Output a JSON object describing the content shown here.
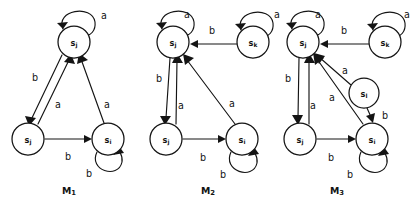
{
  "figure": {
    "width": 414,
    "height": 209,
    "background_color": "#ffffff",
    "ink_color": "#141414",
    "caption_note": "Three finite state machine transition diagrams drawn side by side"
  },
  "symbols": {
    "a": "a",
    "b": "b"
  },
  "machines": [
    {
      "id": "m1",
      "label_base": "M",
      "label_sub": "1",
      "label_x": 69,
      "label_y": 190,
      "states": [
        {
          "id": "sk",
          "base": "s",
          "sub": "j",
          "cx": 74,
          "cy": 42,
          "r": 16
        },
        {
          "id": "sj",
          "base": "s",
          "sub": "j",
          "cx": 28,
          "cy": 139,
          "r": 16
        },
        {
          "id": "si",
          "base": "s",
          "sub": "i",
          "cx": 108,
          "cy": 139,
          "r": 16
        }
      ],
      "edges": [
        {
          "from": "sk",
          "to": "sk",
          "symbol": "a",
          "kind": "self-loop",
          "label_x": 104,
          "label_y": 15
        },
        {
          "from": "sk",
          "to": "sj",
          "symbol": "b",
          "kind": "straight",
          "label_x": 35,
          "label_y": 77
        },
        {
          "from": "sj",
          "to": "sk",
          "symbol": "a",
          "kind": "straight",
          "label_x": 58,
          "label_y": 104
        },
        {
          "from": "sj",
          "to": "si",
          "symbol": "b",
          "kind": "straight",
          "label_x": 68,
          "label_y": 156
        },
        {
          "from": "si",
          "to": "sk",
          "symbol": "a",
          "kind": "straight",
          "label_x": 107,
          "label_y": 104
        },
        {
          "from": "si",
          "to": "si",
          "symbol": "b",
          "kind": "self-loop",
          "label_x": 89,
          "label_y": 173
        }
      ]
    },
    {
      "id": "m2",
      "label_base": "M",
      "label_sub": "2",
      "label_x": 208,
      "label_y": 190,
      "states": [
        {
          "id": "sk",
          "base": "s",
          "sub": "j",
          "cx": 173,
          "cy": 42,
          "r": 16
        },
        {
          "id": "sl",
          "base": "s",
          "sub": "k",
          "cx": 253,
          "cy": 42,
          "r": 16
        },
        {
          "id": "sj",
          "base": "s",
          "sub": "j",
          "cx": 166,
          "cy": 139,
          "r": 16
        },
        {
          "id": "si",
          "base": "s",
          "sub": "i",
          "cx": 242,
          "cy": 139,
          "r": 16
        }
      ],
      "edges": [
        {
          "from": "sk",
          "to": "sk",
          "symbol": "a",
          "kind": "self-loop",
          "label_x": 187,
          "label_y": 14
        },
        {
          "from": "sl",
          "to": "sl",
          "symbol": "a",
          "kind": "self-loop",
          "label_x": 277,
          "label_y": 14
        },
        {
          "from": "sl",
          "to": "sk",
          "symbol": "b",
          "kind": "straight",
          "label_x": 212,
          "label_y": 30
        },
        {
          "from": "sk",
          "to": "sj",
          "symbol": "b",
          "kind": "straight",
          "label_x": 159,
          "label_y": 78
        },
        {
          "from": "sj",
          "to": "sk",
          "symbol": "a",
          "kind": "straight",
          "label_x": 181,
          "label_y": 105
        },
        {
          "from": "sj",
          "to": "si",
          "symbol": "b",
          "kind": "straight",
          "label_x": 203,
          "label_y": 157
        },
        {
          "from": "si",
          "to": "sk",
          "symbol": "a",
          "kind": "straight",
          "label_x": 232,
          "label_y": 103
        },
        {
          "from": "si",
          "to": "si",
          "symbol": "b",
          "kind": "self-loop",
          "label_x": 223,
          "label_y": 174
        }
      ]
    },
    {
      "id": "m3",
      "label_base": "M",
      "label_sub": "3",
      "label_x": 337,
      "label_y": 190,
      "states": [
        {
          "id": "sk",
          "base": "s",
          "sub": "j",
          "cx": 303,
          "cy": 42,
          "r": 16
        },
        {
          "id": "sm",
          "base": "s",
          "sub": "k",
          "cx": 385,
          "cy": 42,
          "r": 16
        },
        {
          "id": "sl",
          "base": "s",
          "sub": "l",
          "cx": 364,
          "cy": 93,
          "r": 15
        },
        {
          "id": "sj",
          "base": "s",
          "sub": "j",
          "cx": 300,
          "cy": 139,
          "r": 16
        },
        {
          "id": "si",
          "base": "s",
          "sub": "i",
          "cx": 372,
          "cy": 139,
          "r": 16
        }
      ],
      "edges": [
        {
          "from": "sk",
          "to": "sk",
          "symbol": "a",
          "kind": "self-loop",
          "label_x": 318,
          "label_y": 14
        },
        {
          "from": "sm",
          "to": "sm",
          "symbol": "a",
          "kind": "self-loop",
          "label_x": 407,
          "label_y": 14
        },
        {
          "from": "sm",
          "to": "sk",
          "symbol": "b",
          "kind": "straight",
          "label_x": 344,
          "label_y": 30
        },
        {
          "from": "sk",
          "to": "sj",
          "symbol": "b",
          "kind": "straight",
          "label_x": 288,
          "label_y": 78
        },
        {
          "from": "sj",
          "to": "sk",
          "symbol": "a",
          "kind": "straight",
          "label_x": 313,
          "label_y": 105
        },
        {
          "from": "sl",
          "to": "sk",
          "symbol": "a",
          "kind": "straight",
          "label_x": 345,
          "label_y": 70
        },
        {
          "from": "sl",
          "to": "si",
          "symbol": "b",
          "kind": "straight",
          "label_x": 385,
          "label_y": 115
        },
        {
          "from": "si",
          "to": "sk",
          "symbol": "a",
          "kind": "straight",
          "label_x": 332,
          "label_y": 97
        },
        {
          "from": "sj",
          "to": "si",
          "symbol": "b",
          "kind": "straight",
          "label_x": 331,
          "label_y": 157
        },
        {
          "from": "si",
          "to": "si",
          "symbol": "b",
          "kind": "self-loop",
          "label_x": 350,
          "label_y": 174
        }
      ]
    }
  ]
}
